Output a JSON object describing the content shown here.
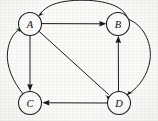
{
  "figure": {
    "width": 158,
    "height": 121,
    "background_color": "#fbfbfa",
    "stroke_color": "#1b1b1b",
    "node_fill_color": "#fdfdfc"
  },
  "graph_data": {
    "type": "directed-graph",
    "node_radius": 11.5,
    "nodes": [
      {
        "id": "A",
        "label": "A",
        "cx": 30,
        "cy": 24
      },
      {
        "id": "B",
        "label": "B",
        "cx": 118,
        "cy": 24
      },
      {
        "id": "C",
        "label": "C",
        "cx": 30,
        "cy": 103
      },
      {
        "id": "D",
        "label": "D",
        "cx": 119,
        "cy": 103
      }
    ],
    "edges": [
      {
        "from": "A",
        "to": "B",
        "shape": "straight",
        "arrow_at": "B"
      },
      {
        "from": "A",
        "to": "C",
        "shape": "straight",
        "arrow_at": "C"
      },
      {
        "from": "A",
        "to": "D",
        "shape": "straight",
        "arrow_at": "D"
      },
      {
        "from": "B",
        "to": "A",
        "shape": "curve-over-top",
        "arrow_at": "A"
      },
      {
        "from": "B",
        "to": "D",
        "shape": "curve-right-bulge",
        "arrow_at": "D"
      },
      {
        "from": "D",
        "to": "B",
        "shape": "straight",
        "arrow_at": "B"
      },
      {
        "from": "D",
        "to": "C",
        "shape": "straight",
        "arrow_at": "C"
      },
      {
        "from": "C",
        "to": "A",
        "shape": "curve-left-bulge",
        "arrow_at": "A"
      }
    ],
    "edge_count": 8,
    "node_count": 4
  }
}
